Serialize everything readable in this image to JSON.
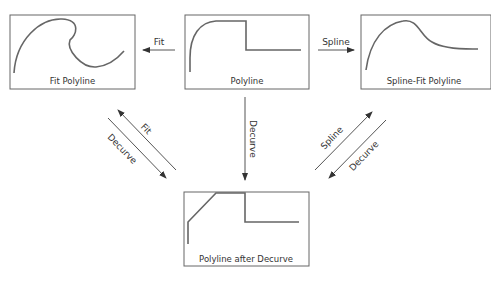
{
  "diagram": {
    "boxes": [
      {
        "id": "fit",
        "label": "Fit Polyline"
      },
      {
        "id": "poly",
        "label": "Polyline"
      },
      {
        "id": "spline",
        "label": "Spline-Fit Polyline"
      },
      {
        "id": "decurve",
        "label": "Polyline after Decurve"
      }
    ],
    "arrows": {
      "poly_to_fit": "Fit",
      "poly_to_spline": "Spline",
      "poly_to_decurve": "Decurve",
      "left_fit": "Fit",
      "left_decurve": "Decurve",
      "right_spline": "Spline",
      "right_decurve": "Decurve"
    },
    "colors": {
      "line": "#555555",
      "curve": "#666666",
      "text": "#333333"
    }
  }
}
